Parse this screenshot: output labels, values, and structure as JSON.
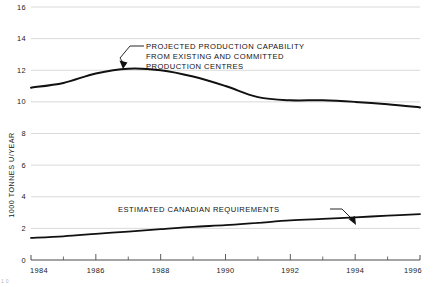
{
  "chart_data": {
    "type": "line",
    "title": "",
    "xlabel": "",
    "ylabel": "1000 TONNES U/YEAR",
    "xlim": [
      1984,
      1996
    ],
    "ylim": [
      0,
      16
    ],
    "ytick_step": 2,
    "yticks": [
      "0",
      "2",
      "4",
      "6",
      "8",
      "10",
      "12",
      "14",
      "16"
    ],
    "xticks_major": [
      "1984",
      "1986",
      "1988",
      "1990",
      "1992",
      "1994",
      "1996"
    ],
    "xticks_minor": [
      "1985",
      "1987",
      "1989",
      "1991",
      "1993",
      "1995"
    ],
    "grid": "horizontal",
    "legend": "none",
    "x": [
      1984,
      1985,
      1986,
      1987,
      1988,
      1989,
      1990,
      1991,
      1992,
      1993,
      1994,
      1995,
      1996
    ],
    "series": [
      {
        "name": "PROJECTED PRODUCTION CAPABILITY FROM EXISTING AND COMMITTED PRODUCTION CENTRES",
        "values": [
          10.9,
          11.2,
          11.8,
          12.1,
          12.0,
          11.6,
          11.0,
          10.3,
          10.1,
          10.1,
          10.0,
          9.85,
          9.65
        ]
      },
      {
        "name": "ESTIMATED CANADIAN REQUIREMENTS",
        "values": [
          1.4,
          1.5,
          1.65,
          1.8,
          1.95,
          2.1,
          2.2,
          2.35,
          2.5,
          2.6,
          2.7,
          2.8,
          2.9
        ]
      }
    ],
    "annotations": [
      {
        "id": "projected-production-annotation",
        "lines": [
          "PROJECTED PRODUCTION CAPABILITY",
          "FROM EXISTING AND COMMITTED",
          "PRODUCTION CENTRES"
        ],
        "points_to_year": 1987,
        "points_to_value": 12.1
      },
      {
        "id": "estimated-requirements-annotation",
        "lines": [
          "ESTIMATED CANADIAN REQUIREMENTS"
        ],
        "points_to_year": 1993.4,
        "points_to_value": 2.62
      }
    ],
    "colors": {
      "line": "#111111",
      "grid": "#c9c9c9",
      "axis": "#4a4a4a",
      "background": "#ffffff"
    }
  },
  "figure": {
    "corner_note": "1 0"
  }
}
